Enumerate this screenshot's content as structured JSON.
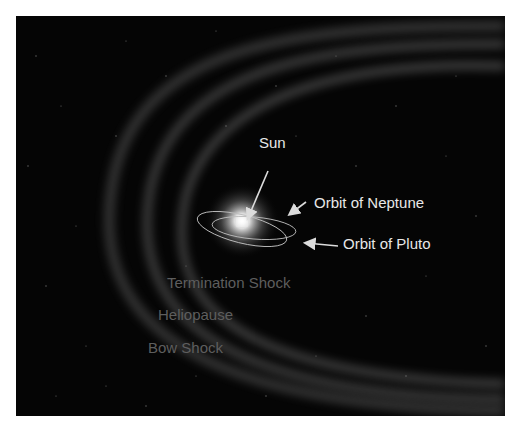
{
  "diagram": {
    "labels": {
      "sun": "Sun",
      "neptune": "Orbit of Neptune",
      "pluto": "Orbit of Pluto",
      "termination_shock": "Termination Shock",
      "heliopause": "Heliopause",
      "bow_shock": "Bow Shock"
    },
    "colors": {
      "background": "#050505",
      "label_bright": "#e8e8e8",
      "label_dim": "#5e5e5e",
      "shell": "#8a8a8a"
    }
  }
}
